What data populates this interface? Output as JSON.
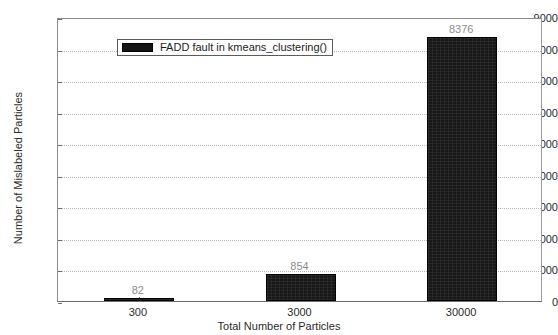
{
  "chart_data": {
    "type": "bar",
    "title": "",
    "xlabel": "Total Number of Particles",
    "ylabel": "Number of Mislabeled Particles",
    "categories": [
      "300",
      "3000",
      "30000"
    ],
    "values": [
      82,
      854,
      8376
    ],
    "value_labels": [
      "82",
      "854",
      "8376"
    ],
    "series": [
      {
        "name": "FADD fault in kmeans_clustering()",
        "values": [
          82,
          854,
          8376
        ],
        "color": "#181818"
      }
    ],
    "ylim": [
      0,
      9000
    ],
    "yticks": [
      0,
      1000,
      2000,
      3000,
      4000,
      5000,
      6000,
      7000,
      8000,
      9000
    ],
    "ytick_labels": [
      "0",
      "1000",
      "2000",
      "3000",
      "4000",
      "5000",
      "6000",
      "7000",
      "8000",
      "9000"
    ],
    "grid": true,
    "grid_axis": "y",
    "legend": {
      "position": "upper-left",
      "entries": [
        "FADD fault in kmeans_clustering()"
      ]
    }
  },
  "legend": {
    "label": "FADD fault in kmeans_clustering()",
    "swatch_color": "#181818"
  },
  "axes": {
    "ylabel": "Number of Mislabeled Particles",
    "xlabel": "Total Number of Particles"
  },
  "colors": {
    "bar": "#181818",
    "value_label": "#8d8d8d",
    "axis_text": "#2b2b2b",
    "gridline": "#b9b9b9",
    "frame": "#8a8a8a",
    "background": "#ffffff"
  }
}
